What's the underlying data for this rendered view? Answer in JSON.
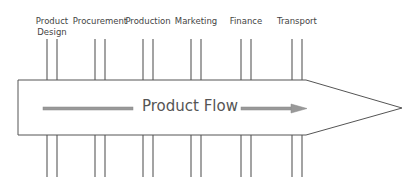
{
  "diagram": {
    "title": "Product Flow",
    "stages": [
      {
        "label": "Product\nDesign",
        "x": 52
      },
      {
        "label": "Procurement",
        "x": 100
      },
      {
        "label": "Production",
        "x": 148
      },
      {
        "label": "Marketing",
        "x": 196
      },
      {
        "label": "Finance",
        "x": 246
      },
      {
        "label": "Transport",
        "x": 297
      }
    ],
    "colors": {
      "outline": "#555555",
      "arrow": "#999999",
      "text": "#444444"
    }
  }
}
